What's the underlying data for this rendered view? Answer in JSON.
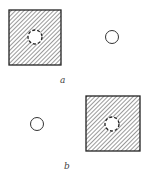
{
  "diagram": {
    "panels": [
      {
        "label": "a",
        "square": {
          "x": 9,
          "y": 10,
          "w": 52,
          "h": 55
        },
        "dashed_circle": {
          "cx": 35,
          "cy": 37,
          "r": 7
        },
        "open_circle": {
          "cx": 112,
          "cy": 37,
          "r": 7
        },
        "label_pos": {
          "x": 62,
          "y": 83
        }
      },
      {
        "label": "b",
        "square": {
          "x": 86,
          "y": 96,
          "w": 54,
          "h": 55
        },
        "dashed_circle": {
          "cx": 112,
          "cy": 124,
          "r": 7
        },
        "open_circle": {
          "cx": 37,
          "cy": 124,
          "r": 7
        },
        "label_pos": {
          "x": 65,
          "y": 169
        }
      }
    ],
    "colors": {
      "stroke": "#222222",
      "hatch": "#555555",
      "background": "#ffffff"
    }
  }
}
